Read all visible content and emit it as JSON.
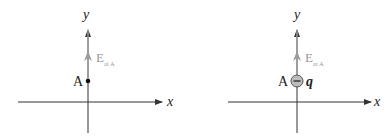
{
  "panels": [
    {
      "id": "left",
      "axis_labels": {
        "x": "x",
        "y": "y"
      },
      "point_label": "A",
      "field_label": {
        "main": "E",
        "subscript": "at A"
      },
      "charge_label": null,
      "charge_sign": null
    },
    {
      "id": "right",
      "axis_labels": {
        "x": "x",
        "y": "y"
      },
      "point_label": "A",
      "field_label": {
        "main": "E",
        "subscript": "at A"
      },
      "charge_label": "q",
      "charge_sign": "−"
    }
  ],
  "colors": {
    "axis": "#333333",
    "field_arrow": "#9a9a9a",
    "field_text": "#9a9a9a",
    "charge_fill": "#bdbdbd",
    "point": "#111111"
  }
}
